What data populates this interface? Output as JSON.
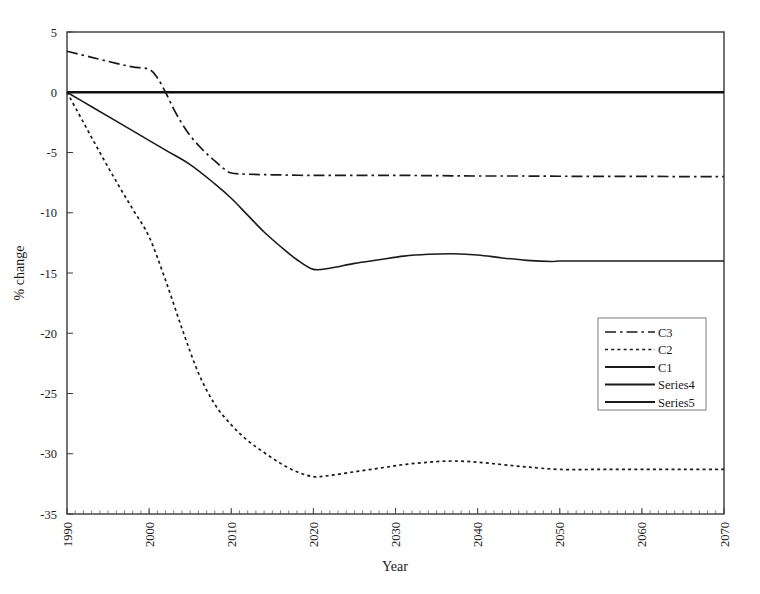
{
  "chart_data": {
    "type": "line",
    "title": "",
    "xlabel": "Year",
    "ylabel": "% change",
    "xlim": [
      1990,
      2070
    ],
    "ylim": [
      -35,
      5
    ],
    "grid": false,
    "legend_position": "inside-right",
    "x_ticks": [
      "1990",
      "2000",
      "2010",
      "2020",
      "2030",
      "2040",
      "2050",
      "2060",
      "2070"
    ],
    "x_tick_values": [
      1990,
      2000,
      2010,
      2020,
      2030,
      2040,
      2050,
      2060,
      2070
    ],
    "x_minor_tick_step": 1,
    "y_ticks": [
      "5",
      "0",
      "-5",
      "-10",
      "-15",
      "-20",
      "-25",
      "-30",
      "-35"
    ],
    "y_tick_values": [
      5,
      0,
      -5,
      -10,
      -15,
      -20,
      -25,
      -30,
      -35
    ],
    "zero_reference_line": 0,
    "series": [
      {
        "name": "C3",
        "style": "dash-dot",
        "color": "#1a1a1a",
        "x": [
          1990,
          1993,
          1996,
          1998,
          2000,
          2001,
          2002,
          2003,
          2004,
          2005,
          2006,
          2007,
          2008,
          2009,
          2010,
          2012,
          2015,
          2020,
          2025,
          2030,
          2035,
          2040,
          2045,
          2050,
          2055,
          2060,
          2065,
          2070
        ],
        "values": [
          3.4,
          2.9,
          2.4,
          2.1,
          1.9,
          1.2,
          0.0,
          -1.4,
          -2.6,
          -3.6,
          -4.4,
          -5.1,
          -5.7,
          -6.3,
          -6.7,
          -6.8,
          -6.85,
          -6.9,
          -6.9,
          -6.9,
          -6.92,
          -6.95,
          -6.95,
          -6.97,
          -6.98,
          -6.98,
          -7.0,
          -7.0
        ]
      },
      {
        "name": "C2",
        "style": "dotted",
        "color": "#1a1a1a",
        "x": [
          1990,
          1992,
          1994,
          1996,
          1998,
          2000,
          2002,
          2004,
          2006,
          2008,
          2010,
          2012,
          2014,
          2016,
          2018,
          2020,
          2022,
          2025,
          2028,
          2031,
          2034,
          2037,
          2040,
          2043,
          2046,
          2050,
          2055,
          2060,
          2065,
          2070
        ],
        "values": [
          0.0,
          -2.5,
          -5.0,
          -7.4,
          -9.7,
          -12.0,
          -15.6,
          -19.6,
          -23.3,
          -25.9,
          -27.6,
          -28.9,
          -29.9,
          -30.8,
          -31.5,
          -31.9,
          -31.8,
          -31.5,
          -31.2,
          -30.9,
          -30.7,
          -30.6,
          -30.7,
          -30.9,
          -31.1,
          -31.3,
          -31.3,
          -31.3,
          -31.3,
          -31.3
        ]
      },
      {
        "name": "C1",
        "style": "solid",
        "color": "#1a1a1a",
        "x": [
          1990,
          1993,
          1996,
          1999,
          2002,
          2005,
          2008,
          2010,
          2012,
          2014,
          2016,
          2018,
          2020,
          2022,
          2025,
          2028,
          2031,
          2034,
          2037,
          2040,
          2043,
          2046,
          2049,
          2050,
          2055,
          2060,
          2065,
          2070
        ],
        "values": [
          0.0,
          -1.2,
          -2.4,
          -3.6,
          -4.8,
          -6.0,
          -7.6,
          -8.8,
          -10.2,
          -11.6,
          -12.8,
          -13.9,
          -14.7,
          -14.6,
          -14.2,
          -13.9,
          -13.6,
          -13.45,
          -13.4,
          -13.5,
          -13.75,
          -13.95,
          -14.05,
          -14.0,
          -14.0,
          -14.0,
          -14.0,
          -14.0
        ]
      },
      {
        "name": "Series4",
        "style": "solid",
        "color": "#111111",
        "x": [
          1990,
          2070
        ],
        "values": [
          0.0,
          0.0
        ]
      },
      {
        "name": "Series5",
        "style": "solid",
        "color": "#111111",
        "x": [
          1990,
          2070
        ],
        "values": [
          0.0,
          0.0
        ]
      }
    ]
  },
  "legend": {
    "entries": [
      {
        "label": "C3"
      },
      {
        "label": "C2"
      },
      {
        "label": "C1"
      },
      {
        "label": "Series4"
      },
      {
        "label": "Series5"
      }
    ]
  },
  "axes": {
    "x_title": "Year",
    "y_title": "% change"
  }
}
